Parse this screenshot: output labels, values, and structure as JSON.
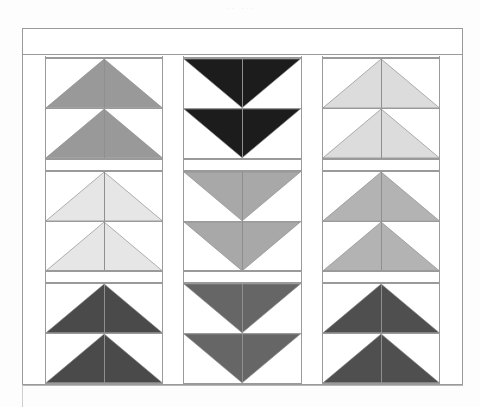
{
  "document": {
    "title": "Flying Geese Quilt Pattern Diagram",
    "top_smudge_text": "·· ···",
    "background_color": "#fdfdfd",
    "frame_color": "#9a9a9a",
    "seam_color": "#8f8f8f",
    "fabric_background": "#ffffff"
  },
  "quilt": {
    "name": "flying-geese-quilt",
    "columns_count": 3,
    "rows_count": 3,
    "units_per_block": 2,
    "top_border_label": "plain border strip",
    "sashing_label": "sashing",
    "columns": [
      {
        "name": "column-left",
        "direction": "up",
        "blocks": [
          {
            "name": "block-left-row1",
            "color": "#999999",
            "shade_label": "medium gray"
          },
          {
            "name": "block-left-row2",
            "color": "#e6e6e6",
            "shade_label": "very light gray"
          },
          {
            "name": "block-left-row3",
            "color": "#4a4a4a",
            "shade_label": "dark gray"
          }
        ]
      },
      {
        "name": "column-center",
        "direction": "down",
        "blocks": [
          {
            "name": "block-center-row1",
            "color": "#1c1c1c",
            "shade_label": "black"
          },
          {
            "name": "block-center-row2",
            "color": "#a8a8a8",
            "shade_label": "medium gray"
          },
          {
            "name": "block-center-row3",
            "color": "#666666",
            "shade_label": "dark medium gray"
          }
        ]
      },
      {
        "name": "column-right",
        "direction": "up",
        "blocks": [
          {
            "name": "block-right-row1",
            "color": "#dcdcdc",
            "shade_label": "light gray"
          },
          {
            "name": "block-right-row2",
            "color": "#b3b3b3",
            "shade_label": "medium light gray"
          },
          {
            "name": "block-right-row3",
            "color": "#4f4f4f",
            "shade_label": "dark gray"
          }
        ]
      }
    ]
  }
}
